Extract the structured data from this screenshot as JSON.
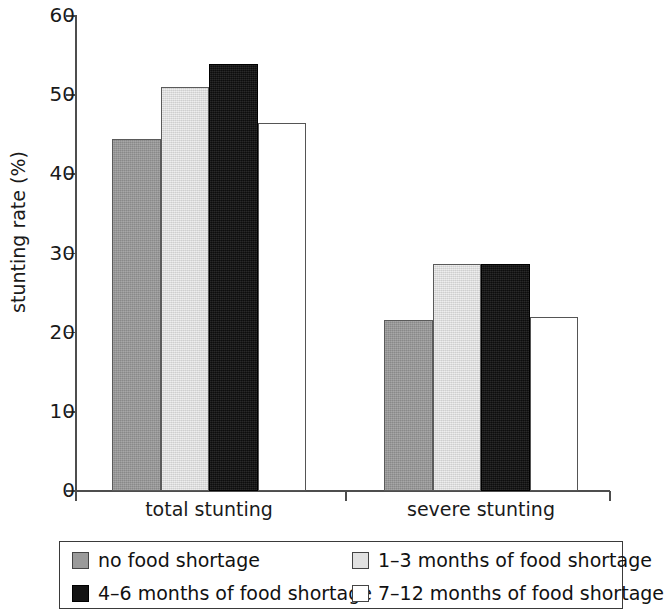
{
  "chart_data": {
    "type": "bar",
    "title": "",
    "xlabel": "",
    "ylabel": "stunting rate (%)",
    "categories": [
      "total stunting",
      "severe stunting"
    ],
    "ylim": [
      0,
      60
    ],
    "yticks": [
      0,
      10,
      20,
      30,
      40,
      50,
      60
    ],
    "ytick_labels": [
      "0",
      "10",
      "20",
      "30",
      "40",
      "50",
      "60"
    ],
    "grid": false,
    "legend_position": "bottom",
    "series": [
      {
        "name": "no food shortage",
        "color": "#9a9a9a",
        "swatch": "gray",
        "values": [
          44.3,
          21.5
        ]
      },
      {
        "name": "1–3 months of food shortage",
        "color": "#e2e2e2",
        "swatch": "light",
        "values": [
          50.9,
          28.6
        ]
      },
      {
        "name": "4–6 months of food shortage",
        "color": "#141414",
        "swatch": "black",
        "values": [
          53.8,
          28.6
        ]
      },
      {
        "name": "7–12 months of food shortage",
        "color": "#ffffff",
        "swatch": "white",
        "values": [
          46.3,
          21.9
        ]
      }
    ]
  },
  "axis": {
    "y_title": "stunting rate (%)",
    "y_labels": {
      "t60": "60",
      "t50": "50",
      "t40": "40",
      "t30": "30",
      "t20": "20",
      "t10": "10",
      "t0": "0"
    },
    "x_labels": {
      "g0": "total stunting",
      "g1": "severe stunting"
    }
  },
  "legend": {
    "items": [
      {
        "label": "no food shortage",
        "swatch": "gray"
      },
      {
        "label": "1–3 months of food shortage",
        "swatch": "light"
      },
      {
        "label": "4–6 months of food shortage",
        "swatch": "black"
      },
      {
        "label": "7–12 months of food shortage",
        "swatch": "white"
      }
    ]
  }
}
